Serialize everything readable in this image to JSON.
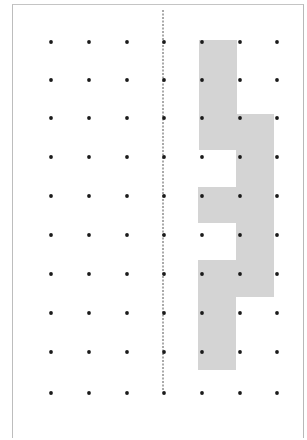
{
  "diagram": {
    "type": "dot-grid-reflection-puzzle",
    "colors": {
      "background": "#ffffff",
      "border": "#bdbdbd",
      "shape_fill": "#d4d4d4",
      "dot": "#1a1a1a",
      "mirror_line": "#555555"
    },
    "grid": {
      "columns_x": [
        51,
        89,
        127,
        164,
        202,
        240,
        277
      ],
      "rows_y": [
        42,
        80,
        118,
        157,
        196,
        235,
        274,
        313,
        352,
        393
      ],
      "dot_radius": 1.9
    },
    "mirror_line": {
      "x": 163,
      "y1": 10,
      "y2": 390,
      "style": "dashed"
    },
    "shape": {
      "points": "199,40 237,40 237,114 274,114 274,297 236,297 236,370 198,370 198,260 236,260 236,223 198,223 198,187 236,187 236,150 199,150"
    }
  }
}
